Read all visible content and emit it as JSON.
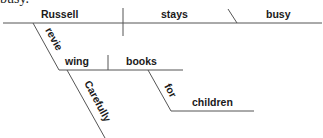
{
  "header_fragment": "busy.",
  "diagram": {
    "type": "sentence-diagram",
    "sentence_words": {
      "subject": "Russell",
      "verb": "stays",
      "predicate_adjective": "busy",
      "gerund_part1": "revie",
      "gerund_part2": "wing",
      "gerund_object": "books",
      "adverb": "Carefully",
      "preposition": "for",
      "prep_object": "children"
    }
  }
}
